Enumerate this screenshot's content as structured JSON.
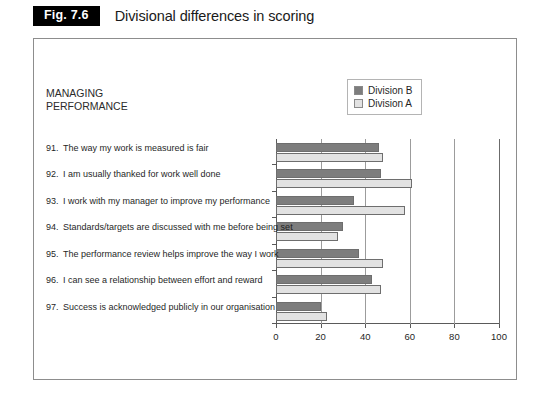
{
  "figure": {
    "tag": "Fig. 7.6",
    "title": "Divisional differences in scoring"
  },
  "chart_block_title": "MANAGING\nPERFORMANCE",
  "legend": {
    "position": "top-right",
    "entries": [
      {
        "label": "Division B",
        "color": "#7d7d7d"
      },
      {
        "label": "Division A",
        "color": "#e2e2e2"
      }
    ]
  },
  "chart_data": {
    "type": "bar",
    "orientation": "horizontal",
    "title": "MANAGING PERFORMANCE",
    "xlabel": "",
    "ylabel": "",
    "xlim": [
      0,
      100
    ],
    "xticks": [
      0,
      20,
      40,
      60,
      80,
      100
    ],
    "grid": true,
    "categories": [
      "91.  The way my work is measured is fair",
      "92.  I am usually thanked for work well done",
      "93.  I work with my manager to improve my performance",
      "94.  Standards/targets are discussed with me before being set",
      "95.  The performance review helps improve the way I work",
      "96.  I can see a relationship between effort and reward",
      "97.  Success is acknowledged publicly in our organisation"
    ],
    "category_numbers": [
      "91.",
      "92.",
      "93.",
      "94.",
      "95.",
      "96.",
      "97."
    ],
    "category_texts": [
      "The way my work is measured is fair",
      "I am usually thanked for work well done",
      "I work with my manager to improve my performance",
      "Standards/targets are discussed with me before being set",
      "The performance review helps improve the way I work",
      "I can see a relationship between effort and reward",
      "Success is acknowledged publicly in our organisation"
    ],
    "series": [
      {
        "name": "Division B",
        "color": "#7d7d7d",
        "values": [
          46,
          47,
          35,
          30,
          37,
          43,
          20
        ]
      },
      {
        "name": "Division A",
        "color": "#e2e2e2",
        "values": [
          48,
          61,
          58,
          28,
          48,
          47,
          23
        ]
      }
    ]
  }
}
